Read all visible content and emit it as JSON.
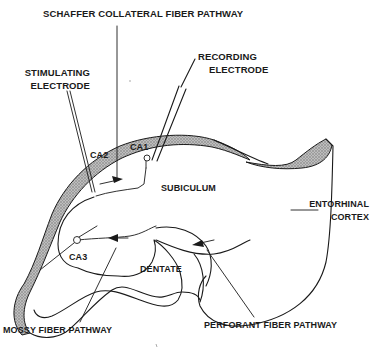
{
  "diagram": {
    "colors": {
      "ink": "#1a1a1a",
      "shading": "#a8a8a8",
      "background": "#ffffff"
    },
    "labels": {
      "schaffer": "SCHAFFER COLLATERAL FIBER PATHWAY",
      "stimulating_line1": "STIMULATING",
      "stimulating_line2": "ELECTRODE",
      "recording_line1": "RECORDING",
      "recording_line2": "ELECTRODE",
      "ca1": "CA1",
      "ca2": "CA2",
      "ca3": "CA3",
      "subiculum": "SUBICULUM",
      "entorhinal_line1": "ENTORHINAL",
      "entorhinal_line2": "CORTEX",
      "dentate": "DENTATE",
      "mossy": "MOSSY FIBER PATHWAY",
      "perforant": "PERFORANT FIBER PATHWAY"
    },
    "elements": [
      {
        "name": "stimulating-electrode",
        "type": "double-line probe"
      },
      {
        "name": "recording-electrode",
        "type": "double-line probe"
      },
      {
        "name": "ca1-neuron",
        "type": "cell body marker"
      },
      {
        "name": "ca3-neuron",
        "type": "cell body marker"
      },
      {
        "name": "schaffer-arrow",
        "direction": "right"
      },
      {
        "name": "mossy-arrow",
        "direction": "left"
      },
      {
        "name": "perforant-arrow",
        "direction": "left"
      }
    ]
  }
}
